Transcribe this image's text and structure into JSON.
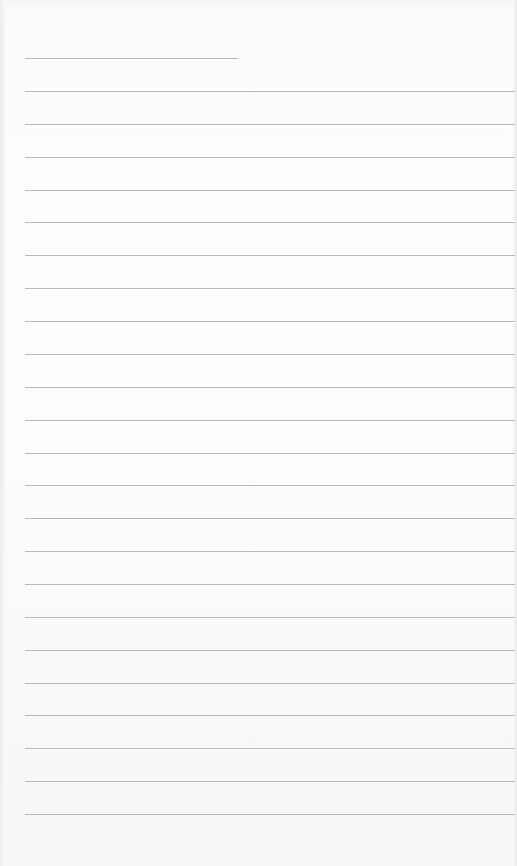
{
  "document": {
    "type": "lined-paper",
    "header_line": {
      "y": 58,
      "x_start": 25,
      "x_end": 238
    },
    "ruled_lines": {
      "count": 23,
      "first_y": 91,
      "last_y": 814,
      "x_start": 25,
      "x_end": 515
    },
    "colors": {
      "paper": "#fbfbfb",
      "rule": "#b9b9b9"
    }
  }
}
